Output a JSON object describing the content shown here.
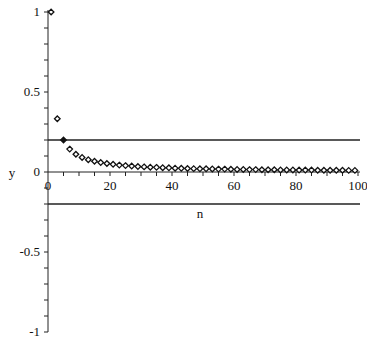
{
  "chart_data": {
    "type": "scatter",
    "title": "",
    "xlabel": "n",
    "ylabel": "y",
    "xlim": [
      0,
      100
    ],
    "ylim": [
      -1,
      1
    ],
    "x_ticks": [
      0,
      20,
      40,
      60,
      80,
      100
    ],
    "x_tick_labels": [
      "0",
      "20",
      "40",
      "60",
      "80",
      "100"
    ],
    "x_minor_step": 5,
    "y_ticks": [
      -1,
      -0.5,
      0,
      0.5,
      1
    ],
    "y_tick_labels": [
      "-1",
      "-0.5",
      "0",
      "0.5",
      "1"
    ],
    "y_minor_step": 0.1,
    "grid": false,
    "legend": null,
    "marker": "diamond-open",
    "series": [
      {
        "name": "a_n = 1/n (odd n)",
        "x": [
          1,
          3,
          5,
          7,
          9,
          11,
          13,
          15,
          17,
          19,
          21,
          23,
          25,
          27,
          29,
          31,
          33,
          35,
          37,
          39,
          41,
          43,
          45,
          47,
          49,
          51,
          53,
          55,
          57,
          59,
          61,
          63,
          65,
          67,
          69,
          71,
          73,
          75,
          77,
          79,
          81,
          83,
          85,
          87,
          89,
          91,
          93,
          95,
          97,
          99
        ],
        "y": [
          1,
          0.333,
          0.2,
          0.143,
          0.111,
          0.091,
          0.077,
          0.067,
          0.059,
          0.053,
          0.048,
          0.043,
          0.04,
          0.037,
          0.034,
          0.032,
          0.03,
          0.029,
          0.027,
          0.026,
          0.024,
          0.023,
          0.022,
          0.021,
          0.02,
          0.02,
          0.019,
          0.018,
          0.018,
          0.017,
          0.016,
          0.016,
          0.015,
          0.015,
          0.014,
          0.014,
          0.014,
          0.013,
          0.013,
          0.013,
          0.012,
          0.012,
          0.012,
          0.011,
          0.011,
          0.011,
          0.011,
          0.011,
          0.01,
          0.01
        ]
      }
    ],
    "highlighted_point": {
      "x": 5,
      "y": 0.2
    },
    "horizontal_lines": [
      {
        "y": 0.2,
        "label": "epsilon upper bound"
      },
      {
        "y": -0.2,
        "label": "epsilon lower bound"
      }
    ]
  },
  "axes": {
    "x_label": "n",
    "y_label": "y"
  }
}
